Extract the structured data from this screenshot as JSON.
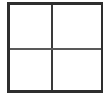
{
  "figure": {
    "title": "",
    "type": "quadrant-grid",
    "background_color": "#ffffff",
    "width_px": 108,
    "height_px": 96
  },
  "frame": {
    "name": "outer-border",
    "color": "#2e2e2e",
    "border_top_px": 3,
    "border_right_px": 2,
    "border_bottom_px": 3,
    "border_left_px": 3,
    "left_px": 7,
    "top_px": 2,
    "width_px": 96,
    "height_px": 91
  },
  "dividers": {
    "vertical": {
      "name": "vertical-divider",
      "color": "#3a3a3a",
      "thickness_px": 2,
      "position_pct": 45.5
    },
    "horizontal": {
      "name": "horizontal-divider",
      "color": "#595959",
      "thickness_px": 2,
      "position_pct": 51
    }
  },
  "cells": [
    {
      "id": "top-left",
      "label": "",
      "fill": "#ffffff"
    },
    {
      "id": "top-right",
      "label": "",
      "fill": "#ffffff"
    },
    {
      "id": "bottom-left",
      "label": "",
      "fill": "#ffffff"
    },
    {
      "id": "bottom-right",
      "label": "",
      "fill": "#ffffff"
    }
  ],
  "chart_data": {
    "type": "table",
    "title": "",
    "subtitle": "",
    "xlabel": "",
    "ylabel": "",
    "grid": true,
    "legend": null,
    "rows": 2,
    "columns": 2,
    "column_headers": [
      "",
      ""
    ],
    "row_headers": [
      "",
      ""
    ],
    "values": [
      [
        "",
        ""
      ],
      [
        "",
        ""
      ]
    ],
    "annotations": []
  }
}
